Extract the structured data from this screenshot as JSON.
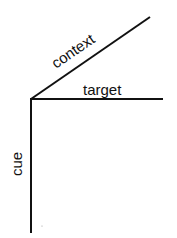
{
  "diagram": {
    "labels": {
      "context": "context",
      "target": "target",
      "cue": "cue"
    },
    "colors": {
      "line": "#111111",
      "background": "#ffffff"
    }
  }
}
